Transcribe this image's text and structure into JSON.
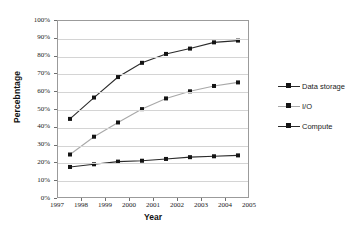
{
  "chart_data": {
    "type": "line",
    "title": "",
    "xlabel": "Year",
    "ylabel": "Percebntage",
    "x": [
      1997.5,
      1998.5,
      1999.5,
      2000.5,
      2001.5,
      2002.5,
      2003.5,
      2004.5
    ],
    "xlim": [
      1997,
      2005
    ],
    "ylim": [
      0,
      100
    ],
    "x_tick_labels": [
      "1997",
      "1998",
      "1999",
      "2000",
      "2001",
      "2002",
      "2003",
      "2004",
      "2005"
    ],
    "x_tick_values": [
      1997,
      1998,
      1999,
      2000,
      2001,
      2002,
      2003,
      2004,
      2005
    ],
    "y_tick_labels": [
      "0%",
      "10%",
      "20%",
      "30%",
      "40%",
      "50%",
      "60%",
      "70%",
      "80%",
      "90%",
      "100%"
    ],
    "y_tick_values": [
      0,
      10,
      20,
      30,
      40,
      50,
      60,
      70,
      80,
      90,
      100
    ],
    "grid": "horizontal",
    "legend_position": "right",
    "series": [
      {
        "name": "Data storage",
        "values": [
          45,
          57,
          68.5,
          76.5,
          81.5,
          84.5,
          88,
          89
        ],
        "color": "#2b2b2b",
        "marker": "square"
      },
      {
        "name": "I/O",
        "values": [
          25,
          35,
          43,
          50.5,
          56.5,
          60.5,
          63.5,
          65.5
        ],
        "color": "#a8a8a8",
        "marker": "square"
      },
      {
        "name": "Compute",
        "values": [
          18,
          19.5,
          21,
          21.5,
          22.5,
          23.5,
          24,
          24.5
        ],
        "color": "#2b2b2b",
        "marker": "square"
      }
    ],
    "marker_color": "#141414",
    "grid_color": "#d4d4d4",
    "frame_color": "#9b9b9b"
  },
  "legend": {
    "items": [
      {
        "label": "Data storage"
      },
      {
        "label": "I/O"
      },
      {
        "label": "Compute"
      }
    ]
  }
}
